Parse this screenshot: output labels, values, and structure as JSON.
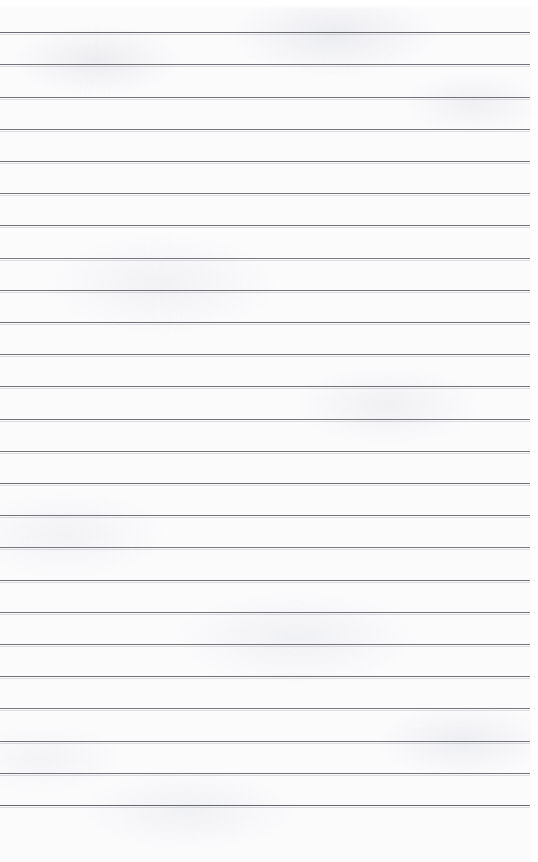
{
  "document": {
    "kind": "scanned-ruled-paper",
    "title": "Blank Ruled Notepad Page",
    "page_width": 538,
    "page_height": 862,
    "has_text": false,
    "has_margin_rule": false,
    "has_punch_holes": false,
    "paper_color": "#fbfbfc",
    "top_highlight_height": 9,
    "right_edge_band_width": 9,
    "bottom_blank_height": 50
  },
  "ruling": {
    "line_color": "#6a6a70",
    "line_thickness": 1,
    "line_count": 25,
    "first_line_y": 32,
    "last_line_y": 805,
    "line_spacing": 32.2,
    "line_start_x": 0,
    "line_end_x": 530,
    "lines": [
      {
        "index": 1,
        "y": 32,
        "x1": 0,
        "x2": 530,
        "color": "#64646b",
        "opacity": 0.95
      },
      {
        "index": 2,
        "y": 64,
        "x1": 0,
        "x2": 530,
        "color": "#6a6a70",
        "opacity": 0.95
      },
      {
        "index": 3,
        "y": 97,
        "x1": 0,
        "x2": 530,
        "color": "#67676e",
        "opacity": 0.93
      },
      {
        "index": 4,
        "y": 129,
        "x1": 0,
        "x2": 530,
        "color": "#6c6c72",
        "opacity": 0.94
      },
      {
        "index": 5,
        "y": 161,
        "x1": 0,
        "x2": 530,
        "color": "#69696f",
        "opacity": 0.95
      },
      {
        "index": 6,
        "y": 193,
        "x1": 0,
        "x2": 530,
        "color": "#6a6a71",
        "opacity": 0.93
      },
      {
        "index": 7,
        "y": 225,
        "x1": 0,
        "x2": 530,
        "color": "#68686e",
        "opacity": 0.95
      },
      {
        "index": 8,
        "y": 258,
        "x1": 0,
        "x2": 530,
        "color": "#6d6d73",
        "opacity": 0.92
      },
      {
        "index": 9,
        "y": 290,
        "x1": 0,
        "x2": 530,
        "color": "#6a6a70",
        "opacity": 0.95
      },
      {
        "index": 10,
        "y": 322,
        "x1": 0,
        "x2": 530,
        "color": "#67676d",
        "opacity": 0.94
      },
      {
        "index": 11,
        "y": 354,
        "x1": 0,
        "x2": 530,
        "color": "#6b6b71",
        "opacity": 0.93
      },
      {
        "index": 12,
        "y": 386,
        "x1": 0,
        "x2": 530,
        "color": "#69696f",
        "opacity": 0.95
      },
      {
        "index": 13,
        "y": 419,
        "x1": 0,
        "x2": 530,
        "color": "#6a6a70",
        "opacity": 0.94
      },
      {
        "index": 14,
        "y": 451,
        "x1": 0,
        "x2": 530,
        "color": "#6c6c72",
        "opacity": 0.93
      },
      {
        "index": 15,
        "y": 483,
        "x1": 0,
        "x2": 530,
        "color": "#68686e",
        "opacity": 0.95
      },
      {
        "index": 16,
        "y": 515,
        "x1": 0,
        "x2": 530,
        "color": "#6a6a71",
        "opacity": 0.94
      },
      {
        "index": 17,
        "y": 547,
        "x1": 0,
        "x2": 530,
        "color": "#6d6d73",
        "opacity": 0.92
      },
      {
        "index": 18,
        "y": 580,
        "x1": 0,
        "x2": 530,
        "color": "#69696f",
        "opacity": 0.95
      },
      {
        "index": 19,
        "y": 612,
        "x1": 0,
        "x2": 530,
        "color": "#6b6b71",
        "opacity": 0.93
      },
      {
        "index": 20,
        "y": 644,
        "x1": 0,
        "x2": 530,
        "color": "#6a6a70",
        "opacity": 0.94
      },
      {
        "index": 21,
        "y": 676,
        "x1": 0,
        "x2": 530,
        "color": "#68686e",
        "opacity": 0.95
      },
      {
        "index": 22,
        "y": 708,
        "x1": 0,
        "x2": 530,
        "color": "#6c6c72",
        "opacity": 0.93
      },
      {
        "index": 23,
        "y": 741,
        "x1": 0,
        "x2": 530,
        "color": "#6a6a71",
        "opacity": 0.94
      },
      {
        "index": 24,
        "y": 773,
        "x1": 0,
        "x2": 530,
        "color": "#69696f",
        "opacity": 0.95
      },
      {
        "index": 25,
        "y": 805,
        "x1": 0,
        "x2": 530,
        "color": "#5f5f66",
        "opacity": 0.96
      }
    ]
  }
}
